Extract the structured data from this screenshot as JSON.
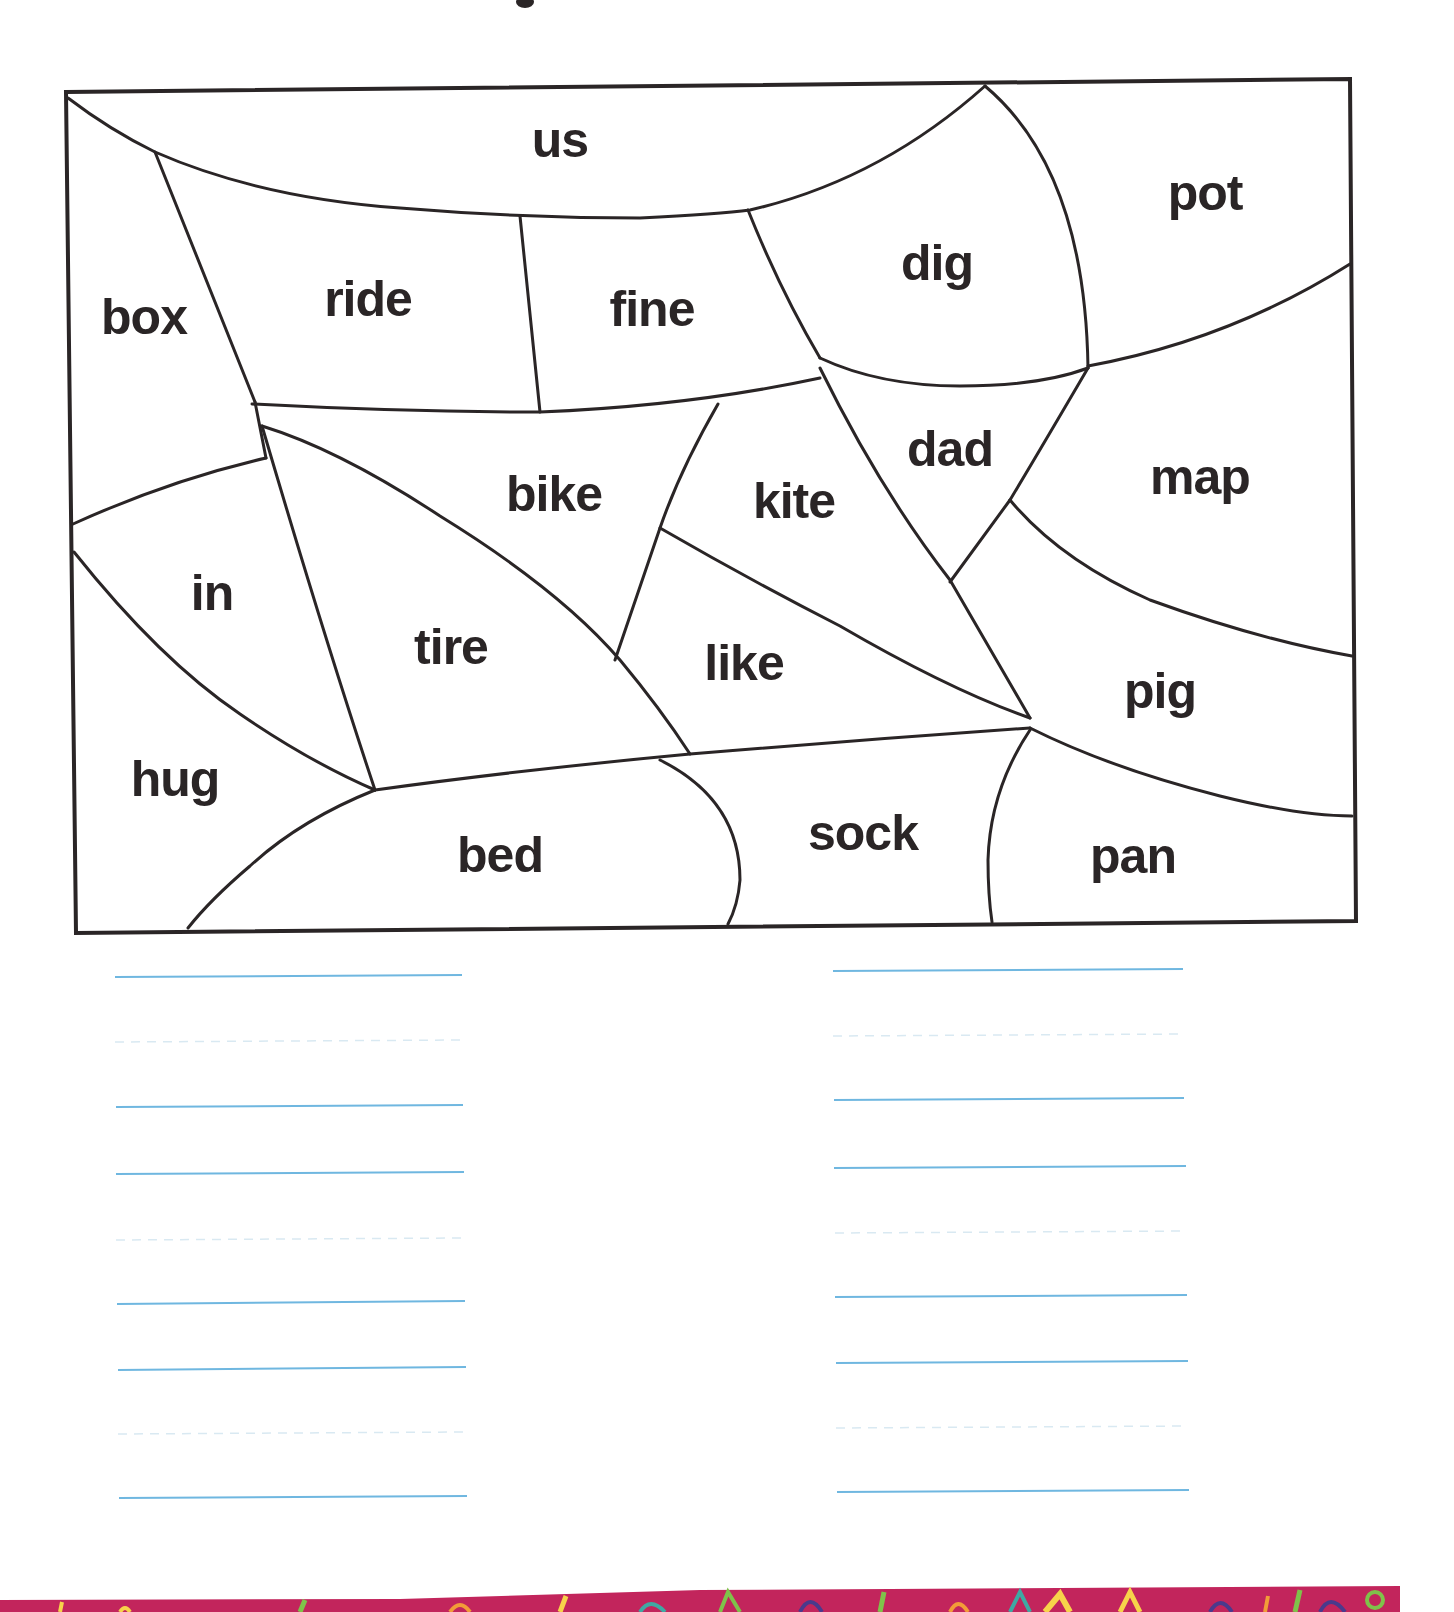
{
  "worksheet": {
    "title_fragment_visible": true,
    "puzzle": {
      "type": "color-by-word region map",
      "regions": [
        {
          "id": "us",
          "label": "us",
          "x": 560,
          "y": 157
        },
        {
          "id": "pot",
          "label": "pot",
          "x": 1205,
          "y": 210
        },
        {
          "id": "dig",
          "label": "dig",
          "x": 937,
          "y": 280
        },
        {
          "id": "box",
          "label": "box",
          "x": 144,
          "y": 334
        },
        {
          "id": "ride",
          "label": "ride",
          "x": 368,
          "y": 316
        },
        {
          "id": "fine",
          "label": "fine",
          "x": 652,
          "y": 326
        },
        {
          "id": "dad",
          "label": "dad",
          "x": 950,
          "y": 466
        },
        {
          "id": "map",
          "label": "map",
          "x": 1200,
          "y": 494
        },
        {
          "id": "bike",
          "label": "bike",
          "x": 554,
          "y": 511
        },
        {
          "id": "kite",
          "label": "kite",
          "x": 794,
          "y": 518
        },
        {
          "id": "in",
          "label": "in",
          "x": 212,
          "y": 610
        },
        {
          "id": "tire",
          "label": "tire",
          "x": 451,
          "y": 664
        },
        {
          "id": "like",
          "label": "like",
          "x": 744,
          "y": 680
        },
        {
          "id": "pig",
          "label": "pig",
          "x": 1160,
          "y": 708
        },
        {
          "id": "hug",
          "label": "hug",
          "x": 175,
          "y": 796
        },
        {
          "id": "sock",
          "label": "sock",
          "x": 863,
          "y": 850
        },
        {
          "id": "bed",
          "label": "bed",
          "x": 500,
          "y": 872
        },
        {
          "id": "pan",
          "label": "pan",
          "x": 1133,
          "y": 873
        }
      ]
    },
    "writing_lines": {
      "left_column": {
        "rows": 4
      },
      "right_column": {
        "rows": 4
      }
    },
    "colors": {
      "ink": "#2a2526",
      "guide_line": "#6fb7e0",
      "guide_dash": "#d9e9f2",
      "strip_base": "#c2255c"
    }
  }
}
